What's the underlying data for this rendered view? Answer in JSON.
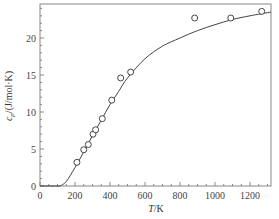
{
  "chart_data": {
    "type": "scatter",
    "title": "",
    "xlabel": "T/K",
    "ylabel": "c_p/(J/mol·K)",
    "xlim": [
      0,
      1320
    ],
    "ylim": [
      0,
      24.3
    ],
    "x_ticks": [
      0,
      200,
      400,
      600,
      800,
      1000,
      1200
    ],
    "y_ticks": [
      0,
      5,
      10,
      15,
      20
    ],
    "grid": false,
    "legend": null,
    "series": [
      {
        "name": "measured",
        "kind": "scatter",
        "marker": "open-circle",
        "x": [
          211,
          250,
          276,
          303,
          318,
          356,
          410,
          461,
          518,
          884,
          1090,
          1267
        ],
        "y": [
          3.2,
          4.9,
          5.6,
          7.0,
          7.6,
          9.1,
          11.6,
          14.6,
          15.4,
          22.7,
          22.7,
          23.6
        ]
      },
      {
        "name": "fit",
        "kind": "line",
        "x": [
          115,
          150,
          200,
          250,
          300,
          350,
          400,
          450,
          500,
          600,
          700,
          800,
          900,
          1000,
          1100,
          1200,
          1320
        ],
        "y": [
          0,
          0.6,
          2.5,
          4.6,
          6.8,
          8.9,
          11.0,
          12.8,
          14.6,
          17.2,
          18.9,
          20.0,
          21.0,
          21.8,
          22.5,
          23.0,
          23.5
        ]
      }
    ]
  },
  "axes": {
    "x_title_main": "T",
    "x_title_unit": "/K",
    "y_title_main": "c",
    "y_title_sub": "p",
    "y_title_unit": "/(J/mol·K)"
  }
}
